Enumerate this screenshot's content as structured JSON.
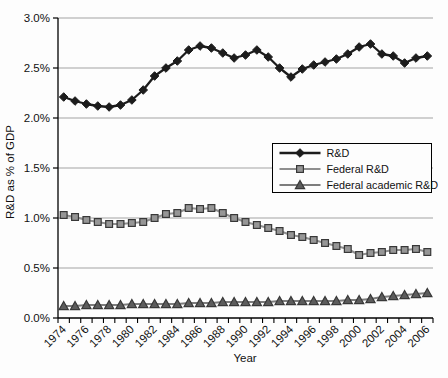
{
  "chart_data": {
    "type": "line",
    "title": "",
    "xlabel": "Year",
    "ylabel": "R&D as % of GDP",
    "x": [
      1974,
      1975,
      1976,
      1977,
      1978,
      1979,
      1980,
      1981,
      1982,
      1983,
      1984,
      1985,
      1986,
      1987,
      1988,
      1989,
      1990,
      1991,
      1992,
      1993,
      1994,
      1995,
      1996,
      1997,
      1998,
      1999,
      2000,
      2001,
      2002,
      2003,
      2004,
      2005,
      2006
    ],
    "x_tick_labels": [
      "1974",
      "1976",
      "1978",
      "1980",
      "1982",
      "1984",
      "1986",
      "1988",
      "1990",
      "1992",
      "1994",
      "1996",
      "1998",
      "2000",
      "2002",
      "2004",
      "2006"
    ],
    "y_ticks": [
      0.0,
      0.5,
      1.0,
      1.5,
      2.0,
      2.5,
      3.0
    ],
    "y_tick_labels": [
      "0.0%",
      "0.5%",
      "1.0%",
      "1.5%",
      "2.0%",
      "2.5%",
      "3.0%"
    ],
    "ylim": [
      0,
      3.0
    ],
    "grid": "horizontal",
    "legend_position": "inside-right",
    "series": [
      {
        "name": "R&D",
        "marker": "diamond",
        "color": "#1c1c1c",
        "marker_fill": "#1c1c1c",
        "marker_stroke": "#1c1c1c",
        "values": [
          2.21,
          2.17,
          2.14,
          2.12,
          2.11,
          2.13,
          2.18,
          2.28,
          2.42,
          2.5,
          2.57,
          2.68,
          2.72,
          2.7,
          2.65,
          2.6,
          2.63,
          2.68,
          2.61,
          2.5,
          2.41,
          2.49,
          2.53,
          2.56,
          2.59,
          2.64,
          2.71,
          2.74,
          2.64,
          2.62,
          2.55,
          2.6,
          2.62
        ]
      },
      {
        "name": "Federal R&D",
        "marker": "square",
        "color": "#8f8f8f",
        "marker_fill": "#969696",
        "marker_stroke": "#383838",
        "values": [
          1.03,
          1.01,
          0.98,
          0.96,
          0.94,
          0.94,
          0.95,
          0.96,
          1.0,
          1.04,
          1.05,
          1.1,
          1.09,
          1.1,
          1.05,
          1.0,
          0.96,
          0.93,
          0.9,
          0.87,
          0.83,
          0.81,
          0.78,
          0.75,
          0.72,
          0.69,
          0.63,
          0.65,
          0.66,
          0.68,
          0.68,
          0.69,
          0.66
        ]
      },
      {
        "name": "Federal academic R&D",
        "marker": "triangle",
        "color": "#7d7d7d",
        "marker_fill": "#5c5c5c",
        "marker_stroke": "#383838",
        "values": [
          0.12,
          0.12,
          0.13,
          0.13,
          0.13,
          0.13,
          0.14,
          0.14,
          0.14,
          0.14,
          0.14,
          0.15,
          0.15,
          0.15,
          0.16,
          0.16,
          0.16,
          0.16,
          0.16,
          0.17,
          0.17,
          0.17,
          0.17,
          0.17,
          0.17,
          0.18,
          0.18,
          0.19,
          0.21,
          0.22,
          0.23,
          0.24,
          0.25
        ]
      }
    ],
    "colors": {
      "axis": "#000000",
      "gridline": "#a3a3a3",
      "legend_border": "#000000",
      "legend_background": "#fdfdfd"
    }
  }
}
